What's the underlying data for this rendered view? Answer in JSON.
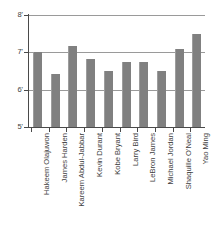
{
  "chart_data": {
    "type": "bar",
    "title": "",
    "xlabel": "",
    "ylabel": "",
    "categories": [
      "Hakeem Olajuwon",
      "James Harden",
      "Kareem Abdul-Jabbar",
      "Kevin Durant",
      "Kobe Bryant",
      "Larry Bird",
      "LeBron James",
      "Michael Jordan",
      "Shaquille O'Neal",
      "Yao Ming"
    ],
    "values": [
      7.0,
      6.42,
      7.17,
      6.83,
      6.5,
      6.75,
      6.75,
      6.5,
      7.08,
      7.5
    ],
    "ylim": [
      5,
      8
    ],
    "yticks": [
      5,
      6,
      7,
      8
    ],
    "ytick_labels": [
      "5'",
      "6'",
      "7'",
      "8'"
    ],
    "gridlines": [
      6,
      7,
      8
    ],
    "grid": true,
    "legend": "none",
    "bar_color": "#808080",
    "grid_color": "#9a9a9a",
    "axis_color": "#4a4a4a",
    "units": "feet"
  }
}
